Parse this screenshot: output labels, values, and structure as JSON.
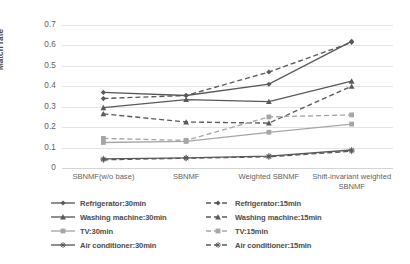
{
  "chart_data": {
    "type": "line",
    "title": "",
    "xlabel": "",
    "ylabel": "Match rate",
    "categories": [
      "SBNMF(w/o base)",
      "SBNMF",
      "Weighted SBNMF",
      "Shift-invariant weighted SBNMF"
    ],
    "ylim": [
      0,
      0.7
    ],
    "ytick_labels": [
      "0.7",
      "0.6",
      "0.5",
      "0.4",
      "0.3",
      "0.2",
      "0.1",
      "0"
    ],
    "ytick_values": [
      0.7,
      0.6,
      0.5,
      0.4,
      0.3,
      0.2,
      0.1,
      0
    ],
    "grid": true,
    "legend_position": "bottom",
    "series": [
      {
        "name": "Refrigerator:30min",
        "values": [
          0.37,
          0.355,
          0.41,
          0.62
        ],
        "color": "#595959",
        "dash": "solid",
        "marker": "diamond"
      },
      {
        "name": "Washing machine:30min",
        "values": [
          0.295,
          0.335,
          0.325,
          0.425
        ],
        "color": "#595959",
        "dash": "solid",
        "marker": "triangle"
      },
      {
        "name": "TV:30min",
        "values": [
          0.125,
          0.13,
          0.175,
          0.215
        ],
        "color": "#a6a6a6",
        "dash": "solid",
        "marker": "square"
      },
      {
        "name": "Air conditioner:30min",
        "values": [
          0.045,
          0.05,
          0.058,
          0.088
        ],
        "color": "#595959",
        "dash": "solid",
        "marker": "star"
      },
      {
        "name": "Refrigerator:15min",
        "values": [
          0.34,
          0.355,
          0.47,
          0.615
        ],
        "color": "#595959",
        "dash": "dashed",
        "marker": "diamond"
      },
      {
        "name": "Washing machine:15min",
        "values": [
          0.265,
          0.225,
          0.22,
          0.4
        ],
        "color": "#595959",
        "dash": "dashed",
        "marker": "triangle"
      },
      {
        "name": "TV:15min",
        "values": [
          0.145,
          0.135,
          0.25,
          0.26
        ],
        "color": "#a6a6a6",
        "dash": "dashed",
        "marker": "square"
      },
      {
        "name": "Air conditioner:15min",
        "values": [
          0.04,
          0.048,
          0.055,
          0.082
        ],
        "color": "#595959",
        "dash": "dashed",
        "marker": "star"
      }
    ]
  }
}
